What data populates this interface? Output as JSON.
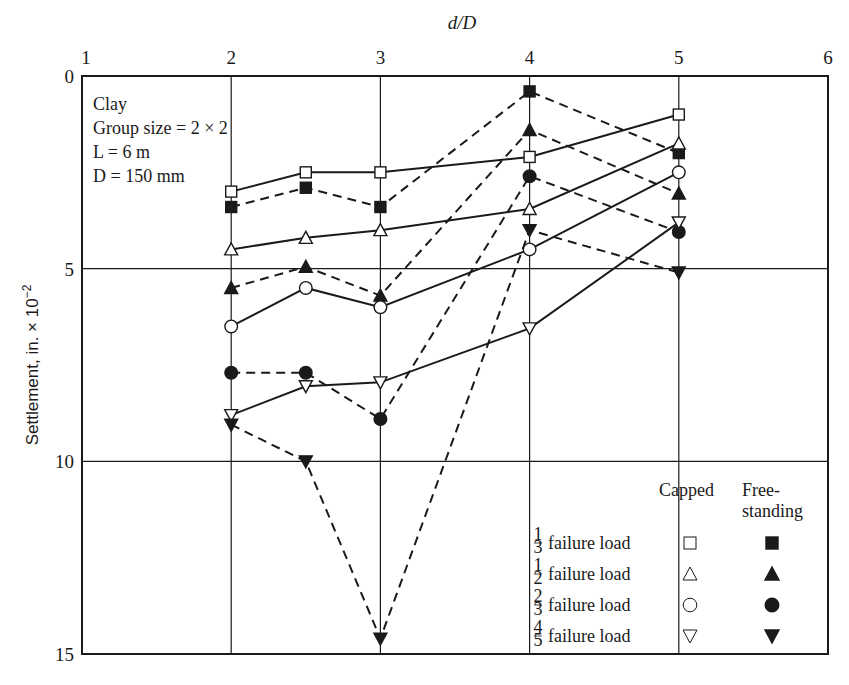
{
  "chart_data": {
    "type": "line",
    "title": "",
    "xlabel": "d/D",
    "ylabel": "Settlement, in. × 10^-2",
    "ylabel_main": "Settlement, in. × 10",
    "ylabel_exp": "−2",
    "x_ticks": [
      "1",
      "2",
      "3",
      "4",
      "5",
      "6"
    ],
    "y_ticks": [
      "0",
      "5",
      "10",
      "15"
    ],
    "xlim": [
      1,
      6
    ],
    "ylim": [
      0,
      15
    ],
    "y_inverted": true,
    "x_axis_position": "top",
    "grid": true,
    "x": [
      2,
      2.5,
      3,
      4,
      5
    ],
    "annotations": [
      "Clay",
      "Group size = 2 × 2",
      "L = 6 m",
      "D = 150 mm"
    ],
    "legend": {
      "position": "lower right",
      "col_headers": [
        "Capped",
        "Free-",
        "standing"
      ],
      "rows": [
        {
          "fraction_num": "1",
          "fraction_den": "3",
          "label": "failure load",
          "capped_marker": "open-square",
          "free_marker": "filled-square"
        },
        {
          "fraction_num": "1",
          "fraction_den": "2",
          "label": "failure load",
          "capped_marker": "open-triangle-up",
          "free_marker": "filled-triangle-up"
        },
        {
          "fraction_num": "2",
          "fraction_den": "3",
          "label": "failure load",
          "capped_marker": "open-circle",
          "free_marker": "filled-circle"
        },
        {
          "fraction_num": "4",
          "fraction_den": "5",
          "label": "failure load",
          "capped_marker": "open-triangle-down",
          "free_marker": "filled-triangle-down"
        }
      ]
    },
    "series": [
      {
        "name": "1/3 failure load, Capped",
        "marker": "open-square",
        "line": "solid",
        "values": [
          3.0,
          2.5,
          2.5,
          2.1,
          1.0
        ]
      },
      {
        "name": "1/3 failure load, Free-standing",
        "marker": "filled-square",
        "line": "dashed",
        "values": [
          3.4,
          2.9,
          3.4,
          0.4,
          2.0
        ]
      },
      {
        "name": "1/2 failure load, Capped",
        "marker": "open-triangle-up",
        "line": "solid",
        "values": [
          4.5,
          4.2,
          4.0,
          3.45,
          1.75
        ]
      },
      {
        "name": "1/2 failure load, Free-standing",
        "marker": "filled-triangle-up",
        "line": "dashed",
        "values": [
          5.5,
          4.95,
          5.7,
          1.4,
          3.05
        ]
      },
      {
        "name": "2/3 failure load, Capped",
        "marker": "open-circle",
        "line": "solid",
        "values": [
          6.5,
          5.5,
          6.0,
          4.5,
          2.5
        ]
      },
      {
        "name": "2/3 failure load, Free-standing",
        "marker": "filled-circle",
        "line": "dashed",
        "values": [
          7.7,
          7.7,
          8.9,
          2.6,
          4.05
        ]
      },
      {
        "name": "4/5 failure load, Capped",
        "marker": "open-triangle-down",
        "line": "solid",
        "values": [
          8.8,
          8.05,
          7.95,
          6.55,
          3.8
        ]
      },
      {
        "name": "4/5 failure load, Free-standing",
        "marker": "filled-triangle-down",
        "line": "dashed",
        "values": [
          9.05,
          10.0,
          14.6,
          4.0,
          5.1
        ]
      }
    ]
  }
}
